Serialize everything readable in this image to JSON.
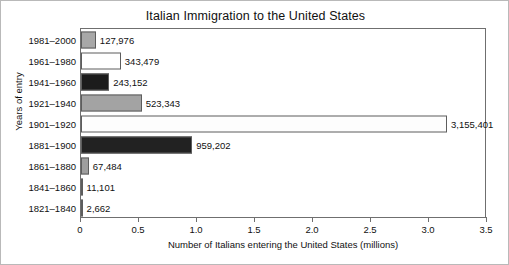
{
  "chart_data": {
    "type": "bar",
    "orientation": "horizontal",
    "title": "Italian Immigration to the United States",
    "xlabel": "Number of Italians entering the United States (millions)",
    "ylabel": "Years of entry",
    "xlim": [
      0,
      3.5
    ],
    "xticks": [
      "0",
      "0.5",
      "1.0",
      "1.5",
      "2.0",
      "2.5",
      "3.0",
      "3.5"
    ],
    "xtick_values": [
      0,
      0.5,
      1.0,
      1.5,
      2.0,
      2.5,
      3.0,
      3.5
    ],
    "grid": false,
    "legend": false,
    "categories": [
      "1981–2000",
      "1961–1980",
      "1941–1960",
      "1921–1940",
      "1901–1920",
      "1881–1900",
      "1861–1880",
      "1841–1860",
      "1821–1840"
    ],
    "values": [
      127976,
      343479,
      243152,
      523343,
      3155401,
      959202,
      67484,
      11101,
      2662
    ],
    "value_labels": [
      "127,976",
      "343,479",
      "243,152",
      "523,343",
      "3,155,401",
      "959,202",
      "67,484",
      "11,101",
      "2,662"
    ],
    "bar_colors": [
      "#a8a8a8",
      "#ffffff",
      "#1c1c1c",
      "#a3a3a3",
      "#fdfdfd",
      "#222222",
      "#9e9e9e",
      "#b5b5b5",
      "#c0c0c0"
    ],
    "bar_edge_color": "#5d5d5d",
    "axis_color": "#6f6f6f",
    "text_color": "#111111",
    "background_color": "#ffffff"
  }
}
